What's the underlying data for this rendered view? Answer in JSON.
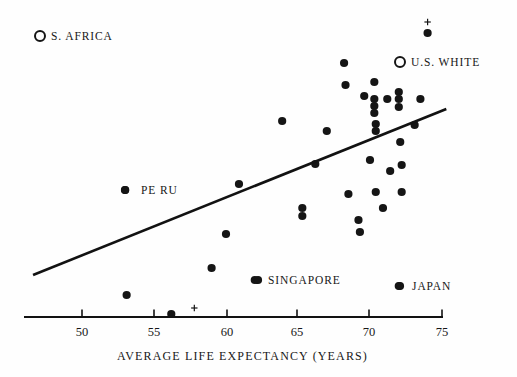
{
  "chart_data": {
    "type": "scatter",
    "title": "",
    "xlabel": "AVERAGE LIFE EXPECTANCY (YEARS)",
    "ylabel": "",
    "xlim": [
      46.5,
      75.5
    ],
    "xticks": [
      50,
      55,
      60,
      65,
      70,
      75
    ],
    "xticklabels": [
      "50",
      "55",
      "60",
      "65",
      "70",
      "75"
    ],
    "grid": false,
    "legend_position": "none",
    "series": [
      {
        "name": "countries",
        "marker": "filled-circle",
        "color": "#151515",
        "points": [
          {
            "x": 53.1,
            "y_px": 295
          },
          {
            "x": 56.2,
            "y_px": 314
          },
          {
            "x": 53.0,
            "y_px": 190,
            "label": "PERU"
          },
          {
            "x": 59.0,
            "y_px": 268
          },
          {
            "x": 60.0,
            "y_px": 234
          },
          {
            "x": 60.9,
            "y_px": 184
          },
          {
            "x": 62.0,
            "y_px": 280,
            "label": "SINGAPORE"
          },
          {
            "x": 63.9,
            "y_px": 121
          },
          {
            "x": 65.3,
            "y_px": 208
          },
          {
            "x": 65.3,
            "y_px": 216
          },
          {
            "x": 66.2,
            "y_px": 164
          },
          {
            "x": 67.0,
            "y_px": 131
          },
          {
            "x": 68.2,
            "y_px": 63
          },
          {
            "x": 68.3,
            "y_px": 85
          },
          {
            "x": 68.5,
            "y_px": 194
          },
          {
            "x": 69.2,
            "y_px": 220
          },
          {
            "x": 69.3,
            "y_px": 232
          },
          {
            "x": 69.6,
            "y_px": 96
          },
          {
            "x": 70.0,
            "y_px": 160
          },
          {
            "x": 70.3,
            "y_px": 82
          },
          {
            "x": 70.3,
            "y_px": 99
          },
          {
            "x": 70.3,
            "y_px": 106
          },
          {
            "x": 70.3,
            "y_px": 113
          },
          {
            "x": 70.4,
            "y_px": 124
          },
          {
            "x": 70.4,
            "y_px": 131
          },
          {
            "x": 70.4,
            "y_px": 192
          },
          {
            "x": 70.9,
            "y_px": 208
          },
          {
            "x": 71.2,
            "y_px": 99
          },
          {
            "x": 71.4,
            "y_px": 171
          },
          {
            "x": 72.0,
            "y_px": 92
          },
          {
            "x": 72.0,
            "y_px": 99
          },
          {
            "x": 72.0,
            "y_px": 107
          },
          {
            "x": 72.1,
            "y_px": 142
          },
          {
            "x": 72.2,
            "y_px": 165
          },
          {
            "x": 72.2,
            "y_px": 192
          },
          {
            "x": 73.1,
            "y_px": 125
          },
          {
            "x": 73.5,
            "y_px": 99
          },
          {
            "x": 74.0,
            "y_px": 33
          },
          {
            "x": 72.0,
            "y_px": 286,
            "label": "JAPAN"
          }
        ]
      },
      {
        "name": "marked-plus",
        "marker": "plus",
        "color": "#151515",
        "points": [
          {
            "x": 74.0,
            "y_px": 22
          },
          {
            "x": 57.8,
            "y_px": 308
          }
        ]
      }
    ],
    "trendline": {
      "x_start": 46.6,
      "y_start_px": 275,
      "x_end": 75.3,
      "y_end_px": 109
    },
    "annotations": [
      {
        "text": "S. AFRICA",
        "marker": "open-circle",
        "marker_x_px": 40,
        "marker_y_px": 36,
        "text_x_px": 51,
        "text_y_px": 31
      },
      {
        "text": "U.S. WHITE",
        "marker": "open-circle",
        "marker_x_px": 400,
        "marker_y_px": 62,
        "text_x_px": 411,
        "text_y_px": 57
      },
      {
        "text": "PERU",
        "marker": "filled-circle",
        "marker_x_px": 125,
        "marker_y_px": 190,
        "text_x_px": 141,
        "text_y_px": 185
      },
      {
        "text": "SINGAPORE",
        "marker": "filled-circle",
        "marker_x_px": 258,
        "marker_y_px": 280,
        "text_x_px": 268,
        "text_y_px": 275
      },
      {
        "text": "JAPAN",
        "marker": "filled-circle",
        "marker_x_px": 400,
        "marker_y_px": 286,
        "text_x_px": 412,
        "text_y_px": 281
      }
    ]
  },
  "axis": {
    "title": "AVERAGE LIFE EXPECTANCY (YEARS)",
    "ticks": [
      {
        "value": "50",
        "x_px": 82
      },
      {
        "value": "55",
        "x_px": 154
      },
      {
        "value": "60",
        "x_px": 227
      },
      {
        "value": "65",
        "x_px": 297
      },
      {
        "value": "70",
        "x_px": 369
      },
      {
        "value": "75",
        "x_px": 442
      }
    ],
    "line_y_px": 317,
    "line_x_start_px": 24,
    "line_x_end_px": 443
  },
  "legend": {
    "items": [
      {
        "label": "S. AFRICA",
        "marker": "open-circle"
      },
      {
        "label": "U.S. WHITE",
        "marker": "open-circle"
      }
    ]
  },
  "point_labels": {
    "peru": "PE RU",
    "singapore": "SINGAPORE",
    "japan": "JAPAN",
    "s_africa": "S. AFRICA",
    "us_white": "U.S. WHITE"
  },
  "colors": {
    "marker": "#151515",
    "line": "#121212",
    "text": "#171717",
    "background": "#ffffff"
  }
}
